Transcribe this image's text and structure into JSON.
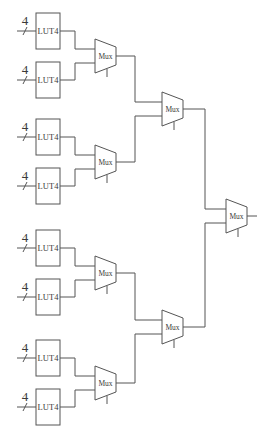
{
  "diagram": {
    "title": "",
    "luts": [
      {
        "label": "LUT4",
        "bus_width": "4",
        "y": 13
      },
      {
        "label": "LUT4",
        "bus_width": "4",
        "y": 62
      },
      {
        "label": "LUT4",
        "bus_width": "4",
        "y": 119
      },
      {
        "label": "LUT4",
        "bus_width": "4",
        "y": 168
      },
      {
        "label": "LUT4",
        "bus_width": "4",
        "y": 230
      },
      {
        "label": "LUT4",
        "bus_width": "4",
        "y": 279
      },
      {
        "label": "LUT4",
        "bus_width": "4",
        "y": 340
      },
      {
        "label": "LUT4",
        "bus_width": "4",
        "y": 389
      }
    ],
    "muxes": {
      "level1": [
        {
          "label": "Mux",
          "x": 95,
          "yc": 56
        },
        {
          "label": "Mux",
          "x": 95,
          "yc": 162
        },
        {
          "label": "Mux",
          "x": 95,
          "yc": 273
        },
        {
          "label": "Mux",
          "x": 95,
          "yc": 383
        }
      ],
      "level2": [
        {
          "label": "Mux",
          "x": 162,
          "yc": 109
        },
        {
          "label": "Mux",
          "x": 162,
          "yc": 327
        }
      ],
      "level3": [
        {
          "label": "Mux",
          "x": 226,
          "yc": 216
        }
      ]
    },
    "colors": {
      "line": "#555555",
      "text": "#3a3a3a",
      "background": "#ffffff"
    }
  }
}
